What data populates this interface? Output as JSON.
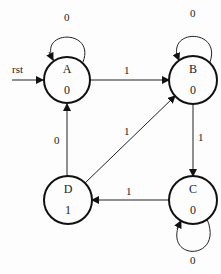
{
  "diagram": {
    "type": "state-machine",
    "reset_label": "rst",
    "states": [
      {
        "id": "A",
        "name": "A",
        "output": "0"
      },
      {
        "id": "B",
        "name": "B",
        "output": "0"
      },
      {
        "id": "C",
        "name": "C",
        "output": "0"
      },
      {
        "id": "D",
        "name": "D",
        "output": "1"
      }
    ],
    "transitions": [
      {
        "from": "A",
        "to": "A",
        "input": "0"
      },
      {
        "from": "A",
        "to": "B",
        "input": "1"
      },
      {
        "from": "B",
        "to": "B",
        "input": "0"
      },
      {
        "from": "B",
        "to": "C",
        "input": "1"
      },
      {
        "from": "C",
        "to": "C",
        "input": "0"
      },
      {
        "from": "C",
        "to": "D",
        "input": "1"
      },
      {
        "from": "D",
        "to": "A",
        "input": "0"
      },
      {
        "from": "D",
        "to": "B",
        "input": "1"
      }
    ]
  }
}
